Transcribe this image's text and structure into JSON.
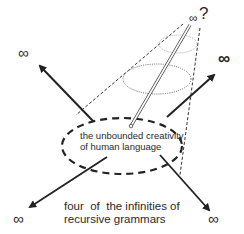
{
  "diagram": {
    "center_label": {
      "line1": "the unbounded creativity",
      "line2": "of human language"
    },
    "caption": {
      "line1": "four  of  the infinities of",
      "line2": "recursive grammars"
    },
    "infinity_symbols": {
      "top": "∞",
      "top_question": "?",
      "upper_left": "∞",
      "upper_right": "∞",
      "lower_left": "∞",
      "lower_right": "∞"
    },
    "colors": {
      "stroke": "#222222",
      "light_stroke": "#888888",
      "background": "#ffffff"
    }
  }
}
